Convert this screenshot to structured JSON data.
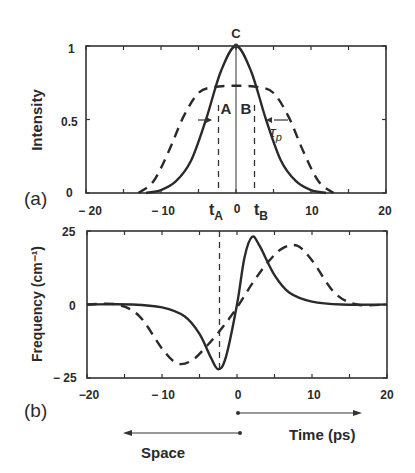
{
  "chart_data": [
    {
      "type": "line",
      "panel_label": "(a)",
      "title": "",
      "xlabel": "",
      "ylabel": "Intensity",
      "xlim": [
        -20,
        20
      ],
      "ylim": [
        0,
        1
      ],
      "x_ticks": [
        "− 20",
        "− 10",
        "0",
        "10",
        "20"
      ],
      "x_tick_values": [
        -20,
        -10,
        0,
        10,
        20
      ],
      "y_ticks": [
        "0",
        "0.5",
        "1"
      ],
      "y_tick_values": [
        0,
        0.5,
        1
      ],
      "grid": false,
      "series": [
        {
          "name": "solid",
          "style": "solid",
          "description": "Gaussian-like pulse, peak 1 at t=0, FWHM ~ 8 ps",
          "x": [
            -12,
            -10,
            -8,
            -6,
            -4,
            -2,
            0,
            2,
            4,
            6,
            8,
            10,
            12
          ],
          "y": [
            0.0,
            0.02,
            0.08,
            0.22,
            0.5,
            0.83,
            1.0,
            0.83,
            0.5,
            0.22,
            0.08,
            0.02,
            0.0
          ]
        },
        {
          "name": "dashed",
          "style": "dashed",
          "description": "Broadened flat-top pulse, plateau ~0.72",
          "x": [
            -13,
            -11,
            -9,
            -7,
            -5,
            -3,
            0,
            3,
            5,
            7,
            9,
            11,
            13
          ],
          "y": [
            0.0,
            0.08,
            0.28,
            0.52,
            0.68,
            0.72,
            0.73,
            0.72,
            0.68,
            0.52,
            0.28,
            0.08,
            0.0
          ]
        }
      ],
      "annotations": [
        {
          "text": "C",
          "x": 0,
          "y": 1.0,
          "note": "peak point"
        },
        {
          "text": "A",
          "x": -2.6,
          "y": 0.6
        },
        {
          "text": "B",
          "x": 2.6,
          "y": 0.6
        },
        {
          "text": "τ",
          "sub": "p",
          "note": "pulse width indicator with arrows at half max"
        },
        {
          "text": "t",
          "sub": "A",
          "x": -2.6,
          "note": "dashed vertical line"
        },
        {
          "text": "t",
          "sub": "B",
          "x": 2.6,
          "note": "dashed vertical line"
        }
      ]
    },
    {
      "type": "line",
      "panel_label": "(b)",
      "title": "",
      "xlabel": "Time (ps)",
      "xlabel_secondary": "Space",
      "ylabel": "Frequency (cm⁻¹)",
      "xlim": [
        -20,
        20
      ],
      "ylim": [
        -25,
        25
      ],
      "x_ticks": [
        "−20",
        "− 10",
        "0",
        "10",
        "20"
      ],
      "x_tick_values": [
        -20,
        -10,
        0,
        10,
        20
      ],
      "y_ticks": [
        "− 25",
        "0",
        "25"
      ],
      "y_tick_values": [
        -25,
        0,
        25
      ],
      "grid": false,
      "series": [
        {
          "name": "solid",
          "style": "solid",
          "description": "Chirp: min ~-22 at t~-2.5, max ~23 at t~2",
          "x": [
            -20,
            -14,
            -10,
            -7,
            -5,
            -3.5,
            -2.5,
            -1.5,
            0,
            1,
            2,
            3,
            5,
            7,
            10,
            14,
            20
          ],
          "y": [
            0,
            0,
            -1,
            -4,
            -10,
            -18,
            -22,
            -18,
            0,
            16,
            23,
            20,
            10,
            4,
            1,
            0,
            0
          ]
        },
        {
          "name": "dashed",
          "style": "dashed",
          "description": "Broader chirp: min ~-20 at t~-7, max ~20 at t~7",
          "x": [
            -20,
            -16,
            -13,
            -10,
            -8,
            -6,
            -4,
            -2,
            0,
            2,
            4,
            6,
            8,
            10,
            13,
            16,
            20
          ],
          "y": [
            0,
            0,
            -4,
            -15,
            -20,
            -19,
            -14,
            -8,
            -1,
            7,
            14,
            19,
            20,
            15,
            4,
            0,
            0
          ]
        }
      ],
      "annotations": [
        {
          "text": "Time (ps)",
          "note": "arrow pointing right from t=0"
        },
        {
          "text": "Space",
          "note": "arrow pointing left from t=0"
        },
        {
          "note": "dashed vertical line at t≈-2.6 extending from panel (a)"
        }
      ]
    }
  ]
}
